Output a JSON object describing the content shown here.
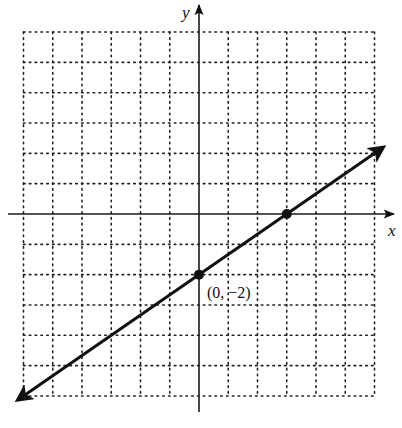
{
  "chart_data": {
    "type": "line",
    "title": "",
    "xlabel": "x",
    "ylabel": "y",
    "xlim": [
      -6,
      6
    ],
    "ylim": [
      -6,
      6
    ],
    "grid": true,
    "grid_style": "dotted",
    "grid_step": 1,
    "equation": "y = (2/3)x - 2",
    "slope": 0.6667,
    "y_intercept": -2,
    "series": [
      {
        "name": "line",
        "x": [
          -6.2,
          6.3
        ],
        "y": [
          -6.13,
          2.2
        ],
        "arrows": "both"
      }
    ],
    "points": [
      {
        "x": 0,
        "y": -2,
        "label": "(0, −2)"
      },
      {
        "x": 3,
        "y": 0,
        "label": ""
      }
    ],
    "annotations": [
      "(0, −2)"
    ]
  },
  "labels": {
    "x_axis": "x",
    "y_axis": "y",
    "point_label": "(0, −2)"
  }
}
